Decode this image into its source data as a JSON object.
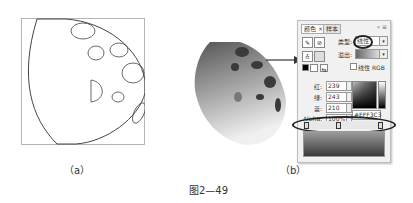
{
  "figure": {
    "caption": "图2—49",
    "sub_a_label": "（a）",
    "sub_b_label": "（b）"
  },
  "color_panel": {
    "tabs": [
      {
        "label": "颜色 ×",
        "active": true
      },
      {
        "label": "样本",
        "active": false
      }
    ],
    "window_controls": "« ≡",
    "type_label": "类型:",
    "type_value": "线性",
    "overflow_label": "溢出:",
    "linear_rgb_label": "线性 RGB",
    "red_label": "红:",
    "red_value": "239",
    "green_label": "绿:",
    "green_value": "243",
    "blue_label": "蓝:",
    "blue_value": "210",
    "alpha_label": "Alpha:",
    "alpha_value": "100%",
    "hex_value": "#EFF3C3",
    "dropdown_glyph": "▾",
    "icons": {
      "stroke": "✎",
      "fill": "⊘",
      "bucket": "♁",
      "swap": "⇆"
    }
  },
  "colors": {
    "outline": "#444444",
    "gradient_light": "#e8e8e8",
    "gradient_dark": "#555555",
    "spots": "#3a3a3a"
  }
}
